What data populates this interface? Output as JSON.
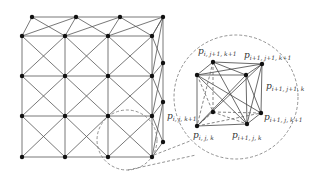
{
  "figure": {
    "colors": {
      "line": "#555555",
      "node": "#111111",
      "dash": "#777777",
      "background": "#ffffff"
    }
  },
  "lattice": {
    "front_x": [
      22,
      65,
      108,
      152
    ],
    "front_y": [
      36,
      76,
      116,
      157
    ],
    "back_top_x": [
      32,
      76,
      120,
      163
    ],
    "back_top_y": 17,
    "back_right_x": 163,
    "back_right_y": [
      17,
      63,
      102,
      142
    ]
  },
  "zoom_circles": {
    "small": {
      "cx": 127,
      "cy": 140,
      "r": 30
    },
    "large": {
      "cx": 236,
      "cy": 97,
      "r": 62
    }
  },
  "cube": {
    "nodes": {
      "btl": [
        213,
        62
      ],
      "btr": [
        262,
        64
      ],
      "ftl": [
        197,
        75
      ],
      "ftr": [
        246,
        75
      ],
      "bbl": [
        213,
        112
      ],
      "bbr": [
        261,
        113
      ],
      "fbl": [
        197,
        126
      ],
      "fbr": [
        247,
        124
      ]
    },
    "labels": [
      {
        "id": "p_i_j1_k1",
        "base": "p",
        "sub": "i, j+1, k+1",
        "x": 198,
        "y": 47
      },
      {
        "id": "p_i1_j1_k1",
        "base": "p",
        "sub": "i+1, j+1, k+1",
        "x": 244,
        "y": 51
      },
      {
        "id": "p_i1_j1_k",
        "base": "p",
        "sub": "i+1, j+1, k",
        "x": 266,
        "y": 82
      },
      {
        "id": "p_i1_j_k1",
        "base": "p",
        "sub": "i+1, j, k+1",
        "x": 264,
        "y": 113
      },
      {
        "id": "p_i_j_k1",
        "base": "p",
        "sub": "i, j, k+1",
        "x": 167,
        "y": 112
      },
      {
        "id": "p_i_j_k",
        "base": "p",
        "sub": "i, j, k",
        "x": 193,
        "y": 131
      },
      {
        "id": "p_i1_j_k",
        "base": "p",
        "sub": "i+1, j, k",
        "x": 232,
        "y": 131
      }
    ]
  }
}
